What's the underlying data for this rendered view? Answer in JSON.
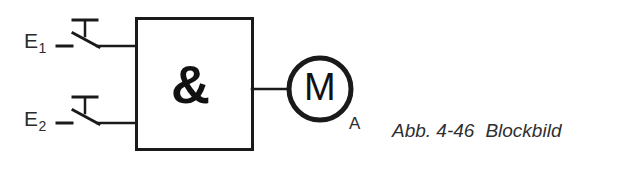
{
  "figure": {
    "type": "logic-circuit-schematic",
    "caption_number": "Abb. 4-46",
    "caption_title": "Blockbild",
    "background_color": "#ffffff",
    "line_color": "#1a1a1a"
  },
  "inputs": [
    {
      "id": "e1",
      "label": "E",
      "subscript": "1",
      "element": "normally-open-pushbutton-switch"
    },
    {
      "id": "e2",
      "label": "E",
      "subscript": "2",
      "element": "normally-open-pushbutton-switch"
    }
  ],
  "gate": {
    "symbol": "&",
    "function": "AND",
    "shape": "rectangle"
  },
  "output": {
    "label": "A",
    "actuator_symbol": "M",
    "actuator_name": "motor"
  }
}
